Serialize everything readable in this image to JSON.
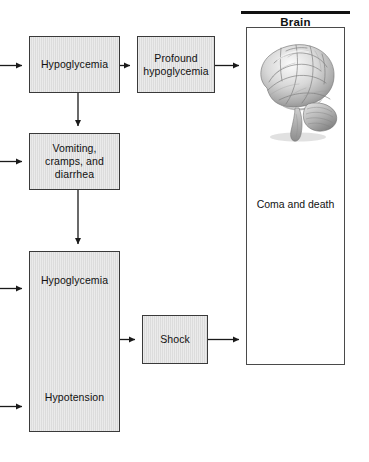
{
  "figure": {
    "type": "flowchart",
    "title": "",
    "orientation": "left-to-right"
  },
  "nodes": [
    {
      "id": "hypoglycemia-1",
      "label": "Hypoglycemia",
      "shape": "rect",
      "fill": "#dcdcdc",
      "border": "#3a3a3a",
      "x": 29,
      "y": 36,
      "w": 91,
      "h": 57
    },
    {
      "id": "profound-hypoglycemia",
      "label": "Profound\nhypoglycemia",
      "shape": "rect",
      "fill": "#dcdcdc",
      "border": "#3a3a3a",
      "x": 137,
      "y": 36,
      "w": 78,
      "h": 57
    },
    {
      "id": "vomiting-cramps-diarrhea",
      "label": "Vomiting,\ncramps, and\ndiarrhea",
      "shape": "rect",
      "fill": "#dcdcdc",
      "border": "#3a3a3a",
      "x": 29,
      "y": 133,
      "w": 91,
      "h": 57
    },
    {
      "id": "hypoglycemia-hypotension",
      "label_top": "Hypoglycemia",
      "label_bottom": "Hypotension",
      "shape": "rect",
      "fill": "#dcdcdc",
      "border": "#3a3a3a",
      "x": 29,
      "y": 251,
      "w": 91,
      "h": 181
    },
    {
      "id": "shock",
      "label": "Shock",
      "shape": "rect",
      "fill": "#dcdcdc",
      "border": "#3a3a3a",
      "x": 142,
      "y": 315,
      "w": 66,
      "h": 49
    }
  ],
  "brain_panel": {
    "title": "Brain",
    "outcome": "Coma and death",
    "illustration": "brain-lateral-grayscale",
    "x": 246,
    "y": 27,
    "w": 99,
    "h": 338,
    "rule": {
      "x": 241,
      "y": 11,
      "w": 109,
      "h": 3,
      "color": "#111111"
    }
  },
  "edges": [
    {
      "id": "in-hypoglycemia-1",
      "from": "left-margin",
      "to": "hypoglycemia-1",
      "kind": "arrow",
      "direction": "right"
    },
    {
      "id": "in-vomiting",
      "from": "left-margin",
      "to": "vomiting-cramps-diarrhea",
      "kind": "arrow",
      "direction": "right"
    },
    {
      "id": "in-hypoglycemia-2",
      "from": "left-margin",
      "to": "hypoglycemia-hypotension",
      "kind": "arrow",
      "direction": "right"
    },
    {
      "id": "in-hypotension",
      "from": "left-margin",
      "to": "hypoglycemia-hypotension",
      "kind": "arrow",
      "direction": "right"
    },
    {
      "id": "hypoglycemia-1-to-profound",
      "from": "hypoglycemia-1",
      "to": "profound-hypoglycemia",
      "kind": "arrow",
      "direction": "right"
    },
    {
      "id": "profound-to-brain",
      "from": "profound-hypoglycemia",
      "to": "brain-panel",
      "kind": "arrow",
      "direction": "right"
    },
    {
      "id": "hypoglycemia-1-to-vomiting",
      "from": "hypoglycemia-1",
      "to": "vomiting-cramps-diarrhea",
      "kind": "arrow",
      "direction": "down"
    },
    {
      "id": "vomiting-to-hypoglycemia-2",
      "from": "vomiting-cramps-diarrhea",
      "to": "hypoglycemia-hypotension",
      "kind": "arrow",
      "direction": "down"
    },
    {
      "id": "hypotension-to-shock",
      "from": "hypoglycemia-hypotension",
      "to": "shock",
      "kind": "arrow",
      "direction": "right"
    },
    {
      "id": "shock-to-brain",
      "from": "shock",
      "to": "brain-panel",
      "kind": "arrow",
      "direction": "right"
    }
  ],
  "colors": {
    "node_fill": "#dcdcdc",
    "node_border": "#3a3a3a",
    "arrow": "#1a1a1a",
    "panel_border": "#4a4a4a",
    "text": "#111111",
    "background": "#ffffff"
  }
}
